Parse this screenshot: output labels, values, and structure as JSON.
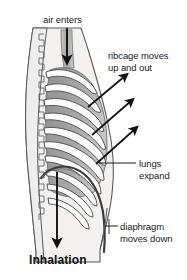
{
  "figure": {
    "title": "Inhalation",
    "background_color": "#ffffff"
  },
  "labels": {
    "air_enters": "air enters",
    "ribcage_line1": "ribcage moves",
    "ribcage_line2": "up and out",
    "lungs_line1": "lungs",
    "lungs_line2": "expand",
    "diaphragm_line1": "diaphragm",
    "diaphragm_line2": "moves down",
    "inhalation": "Inhalation"
  },
  "colors": {
    "ink": "#1b1b1b",
    "body_fill": "#f2f1f0",
    "rib_fill": "#fbfbfb",
    "lung_fill": "#9d9d9d",
    "lung_fill_light": "#b9b9b9",
    "outline": "#58585a",
    "spine_fill": "#ededed",
    "trachea_fill": "#b5b5b5",
    "diaphragm_line": "#3a3a3a",
    "arrow": "#111111"
  },
  "anatomy": {
    "spine": "vertebral-column-serrated",
    "trachea": "windpipe-vertical-channel",
    "ribcage_rib_count": 10,
    "diaphragm": "domed-muscle-moving-down",
    "lungs": "shaded-lung-field"
  },
  "arrows": {
    "air_enters": {
      "direction": "down",
      "meaning": "air flows into trachea"
    },
    "ribcage": [
      {
        "direction": "up-right",
        "meaning": "ribcage moves up and out"
      },
      {
        "direction": "up-right",
        "meaning": "ribcage moves up and out"
      },
      {
        "direction": "up-right",
        "meaning": "ribcage moves up and out"
      }
    ],
    "diaphragm": {
      "direction": "down",
      "meaning": "diaphragm moves down"
    }
  },
  "leader_lines": {
    "lungs": "horizontal-line-to-lung-field",
    "diaphragm": "short-tick-to-body-outline"
  }
}
